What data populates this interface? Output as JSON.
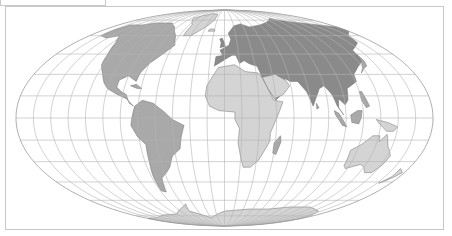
{
  "map": {
    "projection": "Mollweide",
    "graticule_step_deg": 15,
    "center": {
      "x": 224.5,
      "y": 118
    },
    "radii": {
      "rx": 208.5,
      "ry": 108
    },
    "colors": {
      "graticule": "#b4b4b4",
      "outline": "#9a9a9a",
      "land_fill": "#a9a9a9",
      "land_fill_dark": "#8a8a8a",
      "land_stroke": "#6e6e6e",
      "frame": "#c8c8c8",
      "background": "#ffffff"
    },
    "regions": [
      {
        "name": "north-america",
        "shade": "mid",
        "coords": [
          [
            -165,
            65
          ],
          [
            -160,
            70
          ],
          [
            -140,
            70
          ],
          [
            -125,
            72
          ],
          [
            -95,
            72
          ],
          [
            -80,
            68
          ],
          [
            -65,
            60
          ],
          [
            -58,
            52
          ],
          [
            -66,
            45
          ],
          [
            -75,
            38
          ],
          [
            -80,
            31
          ],
          [
            -81,
            25
          ],
          [
            -90,
            29
          ],
          [
            -97,
            26
          ],
          [
            -97,
            21
          ],
          [
            -92,
            18
          ],
          [
            -87,
            16
          ],
          [
            -83,
            10
          ],
          [
            -79,
            8
          ],
          [
            -86,
            13
          ],
          [
            -95,
            16
          ],
          [
            -105,
            20
          ],
          [
            -110,
            24
          ],
          [
            -115,
            30
          ],
          [
            -122,
            37
          ],
          [
            -125,
            45
          ],
          [
            -131,
            54
          ],
          [
            -140,
            60
          ],
          [
            -152,
            58
          ],
          [
            -165,
            60
          ]
        ]
      },
      {
        "name": "greenland",
        "shade": "light",
        "coords": [
          [
            -55,
            60
          ],
          [
            -45,
            60
          ],
          [
            -30,
            68
          ],
          [
            -20,
            75
          ],
          [
            -20,
            82
          ],
          [
            -40,
            83
          ],
          [
            -60,
            80
          ],
          [
            -70,
            77
          ],
          [
            -55,
            70
          ]
        ]
      },
      {
        "name": "south-america",
        "shade": "mid",
        "coords": [
          [
            -78,
            8
          ],
          [
            -72,
            12
          ],
          [
            -62,
            10
          ],
          [
            -52,
            4
          ],
          [
            -45,
            -1
          ],
          [
            -35,
            -5
          ],
          [
            -38,
            -13
          ],
          [
            -40,
            -21
          ],
          [
            -48,
            -26
          ],
          [
            -53,
            -34
          ],
          [
            -58,
            -38
          ],
          [
            -65,
            -42
          ],
          [
            -67,
            -48
          ],
          [
            -69,
            -53
          ],
          [
            -74,
            -52
          ],
          [
            -73,
            -40
          ],
          [
            -71,
            -30
          ],
          [
            -70,
            -18
          ],
          [
            -76,
            -13
          ],
          [
            -81,
            -5
          ],
          [
            -80,
            0
          ]
        ]
      },
      {
        "name": "europe-asia",
        "shade": "dark",
        "coords": [
          [
            -10,
            36
          ],
          [
            -9,
            43
          ],
          [
            -2,
            44
          ],
          [
            -5,
            48
          ],
          [
            5,
            52
          ],
          [
            8,
            57
          ],
          [
            5,
            62
          ],
          [
            15,
            69
          ],
          [
            28,
            71
          ],
          [
            40,
            68
          ],
          [
            60,
            70
          ],
          [
            80,
            73
          ],
          [
            100,
            77
          ],
          [
            115,
            74
          ],
          [
            140,
            72
          ],
          [
            160,
            70
          ],
          [
            180,
            68
          ],
          [
            180,
            64
          ],
          [
            165,
            60
          ],
          [
            160,
            54
          ],
          [
            142,
            48
          ],
          [
            140,
            40
          ],
          [
            130,
            35
          ],
          [
            122,
            30
          ],
          [
            121,
            25
          ],
          [
            110,
            20
          ],
          [
            108,
            12
          ],
          [
            105,
            9
          ],
          [
            100,
            13
          ],
          [
            99,
            7
          ],
          [
            103,
            2
          ],
          [
            98,
            8
          ],
          [
            95,
            16
          ],
          [
            90,
            22
          ],
          [
            85,
            20
          ],
          [
            80,
            13
          ],
          [
            77,
            8
          ],
          [
            73,
            18
          ],
          [
            67,
            25
          ],
          [
            60,
            25
          ],
          [
            56,
            27
          ],
          [
            52,
            17
          ],
          [
            45,
            12
          ],
          [
            39,
            20
          ],
          [
            35,
            28
          ],
          [
            32,
            36
          ],
          [
            27,
            37
          ],
          [
            24,
            38
          ],
          [
            20,
            40
          ],
          [
            15,
            38
          ],
          [
            12,
            44
          ],
          [
            8,
            44
          ],
          [
            3,
            42
          ]
        ]
      },
      {
        "name": "africa",
        "shade": "light",
        "coords": [
          [
            -17,
            15
          ],
          [
            -16,
            22
          ],
          [
            -10,
            30
          ],
          [
            -6,
            35
          ],
          [
            10,
            37
          ],
          [
            20,
            32
          ],
          [
            32,
            31
          ],
          [
            35,
            28
          ],
          [
            43,
            12
          ],
          [
            51,
            11
          ],
          [
            44,
            -2
          ],
          [
            40,
            -10
          ],
          [
            40,
            -16
          ],
          [
            35,
            -24
          ],
          [
            32,
            -29
          ],
          [
            25,
            -34
          ],
          [
            18,
            -34
          ],
          [
            15,
            -27
          ],
          [
            12,
            -17
          ],
          [
            13,
            -7
          ],
          [
            9,
            -1
          ],
          [
            9,
            4
          ],
          [
            -5,
            5
          ],
          [
            -13,
            8
          ]
        ]
      },
      {
        "name": "madagascar",
        "shade": "mid",
        "coords": [
          [
            49,
            -12
          ],
          [
            50,
            -16
          ],
          [
            47,
            -25
          ],
          [
            44,
            -24
          ],
          [
            44,
            -17
          ]
        ]
      },
      {
        "name": "arabia",
        "shade": "light",
        "coords": [
          [
            35,
            28
          ],
          [
            48,
            30
          ],
          [
            56,
            26
          ],
          [
            59,
            22
          ],
          [
            52,
            16
          ],
          [
            44,
            13
          ],
          [
            39,
            20
          ]
        ]
      },
      {
        "name": "borneo",
        "shade": "mid",
        "coords": [
          [
            109,
            2
          ],
          [
            115,
            5
          ],
          [
            119,
            5
          ],
          [
            118,
            0
          ],
          [
            116,
            -4
          ],
          [
            110,
            -3
          ]
        ]
      },
      {
        "name": "sumatra",
        "shade": "mid",
        "coords": [
          [
            95,
            5
          ],
          [
            99,
            3
          ],
          [
            106,
            -6
          ],
          [
            102,
            -5
          ],
          [
            96,
            2
          ]
        ]
      },
      {
        "name": "new-guinea",
        "shade": "light",
        "coords": [
          [
            131,
            -1
          ],
          [
            141,
            -3
          ],
          [
            150,
            -6
          ],
          [
            147,
            -9
          ],
          [
            141,
            -9
          ],
          [
            134,
            -4
          ]
        ]
      },
      {
        "name": "japan",
        "shade": "mid",
        "coords": [
          [
            130,
            31
          ],
          [
            135,
            34
          ],
          [
            140,
            36
          ],
          [
            142,
            40
          ],
          [
            141,
            45
          ],
          [
            139,
            40
          ],
          [
            135,
            35
          ]
        ]
      },
      {
        "name": "australia",
        "shade": "light",
        "coords": [
          [
            114,
            -22
          ],
          [
            122,
            -18
          ],
          [
            130,
            -12
          ],
          [
            136,
            -12
          ],
          [
            137,
            -16
          ],
          [
            142,
            -11
          ],
          [
            146,
            -19
          ],
          [
            153,
            -26
          ],
          [
            151,
            -33
          ],
          [
            147,
            -38
          ],
          [
            140,
            -38
          ],
          [
            135,
            -34
          ],
          [
            130,
            -32
          ],
          [
            118,
            -35
          ],
          [
            115,
            -33
          ]
        ]
      },
      {
        "name": "new-zealand",
        "shade": "light",
        "coords": [
          [
            172,
            -35
          ],
          [
            178,
            -38
          ],
          [
            175,
            -41
          ],
          [
            171,
            -44
          ],
          [
            167,
            -46
          ],
          [
            172,
            -41
          ]
        ]
      },
      {
        "name": "uk",
        "shade": "dark",
        "coords": [
          [
            -5,
            50
          ],
          [
            1,
            51
          ],
          [
            0,
            54
          ],
          [
            -3,
            58
          ],
          [
            -6,
            57
          ],
          [
            -4,
            54
          ]
        ]
      },
      {
        "name": "antarctica",
        "shade": "light",
        "coords": [
          [
            -180,
            -78
          ],
          [
            -150,
            -77
          ],
          [
            -120,
            -74
          ],
          [
            -90,
            -73
          ],
          [
            -60,
            -65
          ],
          [
            -55,
            -63
          ],
          [
            -60,
            -70
          ],
          [
            -30,
            -77
          ],
          [
            0,
            -70
          ],
          [
            40,
            -68
          ],
          [
            70,
            -68
          ],
          [
            100,
            -66
          ],
          [
            130,
            -66
          ],
          [
            160,
            -70
          ],
          [
            180,
            -78
          ],
          [
            180,
            -89
          ],
          [
            -180,
            -89
          ]
        ]
      },
      {
        "name": "cuba",
        "shade": "mid",
        "coords": [
          [
            -85,
            22
          ],
          [
            -80,
            23
          ],
          [
            -74,
            20
          ],
          [
            -78,
            20
          ]
        ]
      },
      {
        "name": "iceland",
        "shade": "light",
        "coords": [
          [
            -24,
            64
          ],
          [
            -14,
            64
          ],
          [
            -15,
            66
          ],
          [
            -22,
            66
          ]
        ]
      },
      {
        "name": "sri-lanka",
        "shade": "mid",
        "coords": [
          [
            80,
            10
          ],
          [
            82,
            7
          ],
          [
            80,
            6
          ]
        ]
      },
      {
        "name": "philippines",
        "shade": "mid",
        "coords": [
          [
            120,
            18
          ],
          [
            122,
            18
          ],
          [
            126,
            8
          ],
          [
            123,
            7
          ],
          [
            120,
            12
          ]
        ]
      }
    ]
  },
  "corner_box": {
    "visible": true
  }
}
